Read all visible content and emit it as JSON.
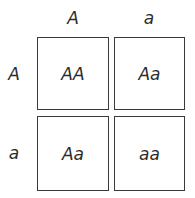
{
  "punnett": {
    "columns": [
      "A",
      "a"
    ],
    "rows": [
      "A",
      "a"
    ],
    "cells": [
      [
        "AA",
        "Aa"
      ],
      [
        "Aa",
        "aa"
      ]
    ]
  }
}
